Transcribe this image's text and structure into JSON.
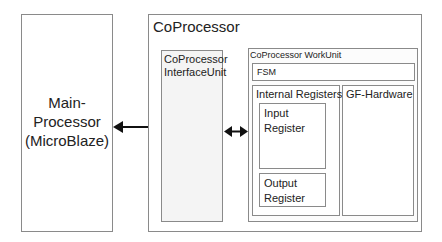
{
  "diagram": {
    "main_processor": {
      "label_lines": [
        "Main-",
        "Processor",
        "(MicroBlaze)"
      ]
    },
    "coprocessor": {
      "title": "CoProcessor",
      "interface_unit": {
        "label_lines": [
          "CoProcessor",
          "InterfaceUnit"
        ]
      },
      "work_unit": {
        "title": "CoProcessor WorkUnit",
        "fsm": {
          "label": "FSM"
        },
        "internal_registers": {
          "title": "Internal Registers",
          "input_register": {
            "label_lines": [
              "Input",
              "Register"
            ]
          },
          "output_register": {
            "label_lines": [
              "Output",
              "Register"
            ]
          }
        },
        "gf_hardware": {
          "title": "GF-Hardware"
        }
      }
    },
    "connections": [
      {
        "from": "Main-Processor (MicroBlaze)",
        "to": "CoProcessor InterfaceUnit",
        "type": "bidirectional-arrow"
      },
      {
        "from": "CoProcessor InterfaceUnit",
        "to": "CoProcessor WorkUnit",
        "type": "bidirectional-arrow"
      }
    ],
    "colors": {
      "border": "#8a8a8a",
      "arrow": "#111111",
      "interface_fill": "#f4f4f4",
      "background": "#ffffff"
    }
  }
}
